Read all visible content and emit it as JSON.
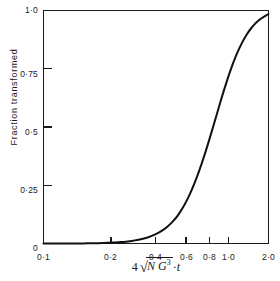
{
  "chart_data": {
    "type": "line",
    "title": "",
    "subtitle": "",
    "xlabel": "4 √(Ṅ G³)·t",
    "xlabel_parts": {
      "coefficient": "4",
      "radical_sign": "√",
      "radicand_first": "N",
      "radicand_second": "G",
      "radicand_second_exponent": "3",
      "separator": "·",
      "trailing_variable": "t"
    },
    "ylabel": "Fraction transformed",
    "xscale": "log",
    "yscale": "linear",
    "xlim": [
      0.1,
      2.0
    ],
    "ylim": [
      0,
      1.0
    ],
    "grid": false,
    "legend": null,
    "xticks": [
      0.1,
      0.2,
      0.4,
      0.6,
      0.8,
      1.0,
      2.0
    ],
    "xticklabels": [
      "0·1",
      "0·2",
      "0·4",
      "0·6",
      "0·8",
      "1·0",
      "2·0"
    ],
    "yticks": [
      0,
      0.25,
      0.5,
      0.75,
      1.0
    ],
    "yticklabels": [
      "0",
      "0·25",
      "0·5",
      "0·75",
      "1·0"
    ],
    "series": [
      {
        "name": "Fraction transformed (JMAK / Avrami)",
        "color": "#111111",
        "x": [
          0.1,
          0.12,
          0.14,
          0.16,
          0.18,
          0.2,
          0.22,
          0.25,
          0.28,
          0.3,
          0.33,
          0.36,
          0.4,
          0.44,
          0.48,
          0.52,
          0.56,
          0.6,
          0.65,
          0.7,
          0.75,
          0.8,
          0.85,
          0.9,
          0.95,
          1.0,
          1.05,
          1.1,
          1.2,
          1.3,
          1.4,
          1.5,
          1.6,
          1.75,
          2.0
        ],
        "y": [
          0.0,
          0.0,
          0.0,
          0.0,
          0.001,
          0.001,
          0.002,
          0.004,
          0.006,
          0.008,
          0.012,
          0.017,
          0.026,
          0.038,
          0.053,
          0.072,
          0.095,
          0.122,
          0.163,
          0.21,
          0.262,
          0.318,
          0.376,
          0.435,
          0.493,
          0.549,
          0.603,
          0.653,
          0.739,
          0.807,
          0.859,
          0.898,
          0.927,
          0.957,
          0.985
        ]
      }
    ],
    "annotations": []
  },
  "figure": {
    "background_color": "#ffffff",
    "axis_color": "#1a1a1a",
    "curve_color": "#111111"
  }
}
